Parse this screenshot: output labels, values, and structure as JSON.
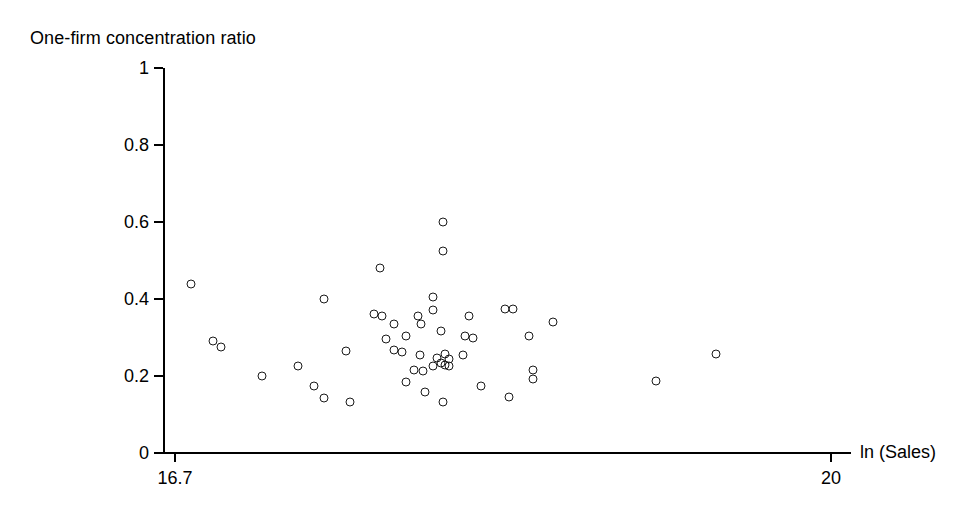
{
  "chart_data": {
    "type": "scatter",
    "title": "",
    "ylabel": "One-firm concentration ratio",
    "xlabel": "ln (Sales)",
    "xlim": [
      16.7,
      20.0
    ],
    "ylim": [
      0,
      1
    ],
    "grid": false,
    "legend": null,
    "xticks": [
      16.7,
      20
    ],
    "xticklabels": [
      "16.7",
      "20"
    ],
    "yticks": [
      0,
      0.2,
      0.4,
      0.6,
      0.8,
      1
    ],
    "yticklabels": [
      "0",
      "0.2",
      "0.4",
      "0.6",
      "0.8",
      "1"
    ],
    "marker": "open-circle",
    "marker_color": "#1a1a1a",
    "points": [
      {
        "x": 16.78,
        "y": 0.44
      },
      {
        "x": 16.89,
        "y": 0.29
      },
      {
        "x": 16.93,
        "y": 0.275
      },
      {
        "x": 17.14,
        "y": 0.2
      },
      {
        "x": 17.32,
        "y": 0.225
      },
      {
        "x": 17.4,
        "y": 0.175
      },
      {
        "x": 17.45,
        "y": 0.142
      },
      {
        "x": 17.45,
        "y": 0.4
      },
      {
        "x": 17.56,
        "y": 0.265
      },
      {
        "x": 17.58,
        "y": 0.132
      },
      {
        "x": 17.73,
        "y": 0.48
      },
      {
        "x": 17.7,
        "y": 0.36
      },
      {
        "x": 17.74,
        "y": 0.355
      },
      {
        "x": 17.8,
        "y": 0.335
      },
      {
        "x": 17.76,
        "y": 0.295
      },
      {
        "x": 17.8,
        "y": 0.268
      },
      {
        "x": 17.84,
        "y": 0.262
      },
      {
        "x": 17.86,
        "y": 0.185
      },
      {
        "x": 17.9,
        "y": 0.215
      },
      {
        "x": 17.86,
        "y": 0.305
      },
      {
        "x": 17.92,
        "y": 0.355
      },
      {
        "x": 17.94,
        "y": 0.335
      },
      {
        "x": 17.93,
        "y": 0.255
      },
      {
        "x": 17.95,
        "y": 0.212
      },
      {
        "x": 18.0,
        "y": 0.225
      },
      {
        "x": 18.02,
        "y": 0.248
      },
      {
        "x": 18.04,
        "y": 0.235
      },
      {
        "x": 18.06,
        "y": 0.228
      },
      {
        "x": 18.05,
        "y": 0.6
      },
      {
        "x": 18.05,
        "y": 0.525
      },
      {
        "x": 18.0,
        "y": 0.405
      },
      {
        "x": 18.0,
        "y": 0.372
      },
      {
        "x": 18.04,
        "y": 0.316
      },
      {
        "x": 18.06,
        "y": 0.258
      },
      {
        "x": 18.08,
        "y": 0.245
      },
      {
        "x": 18.08,
        "y": 0.225
      },
      {
        "x": 18.05,
        "y": 0.132
      },
      {
        "x": 17.96,
        "y": 0.158
      },
      {
        "x": 18.15,
        "y": 0.255
      },
      {
        "x": 18.18,
        "y": 0.355
      },
      {
        "x": 18.16,
        "y": 0.305
      },
      {
        "x": 18.2,
        "y": 0.3
      },
      {
        "x": 18.24,
        "y": 0.175
      },
      {
        "x": 18.36,
        "y": 0.375
      },
      {
        "x": 18.4,
        "y": 0.375
      },
      {
        "x": 18.38,
        "y": 0.145
      },
      {
        "x": 18.48,
        "y": 0.305
      },
      {
        "x": 18.5,
        "y": 0.215
      },
      {
        "x": 18.5,
        "y": 0.192
      },
      {
        "x": 18.6,
        "y": 0.34
      },
      {
        "x": 19.12,
        "y": 0.188
      },
      {
        "x": 19.42,
        "y": 0.256
      }
    ]
  }
}
